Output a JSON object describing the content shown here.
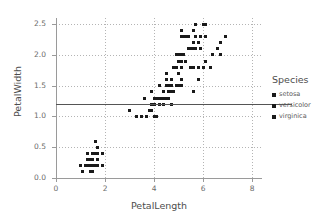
{
  "chart_data": {
    "type": "scatter",
    "title": "",
    "xlabel": "PetalLength",
    "ylabel": "PetalWidth",
    "xlim": [
      0,
      8.4
    ],
    "ylim": [
      0,
      2.6
    ],
    "xticks": [
      "0",
      "2",
      "4",
      "6",
      "8"
    ],
    "xtick_values": [
      0,
      2,
      4,
      6,
      8
    ],
    "yticks": [
      "0.0",
      "0.5",
      "1.0",
      "1.5",
      "2.0",
      "2.5"
    ],
    "ytick_values": [
      0.0,
      0.5,
      1.0,
      1.5,
      2.0,
      2.5
    ],
    "grid": true,
    "grid_style": "dotted",
    "legend_position": "right",
    "legend_title": "Species",
    "marker": "square",
    "marker_color": "#1a1a1a",
    "reference_line": {
      "orientation": "horizontal",
      "y": 1.2,
      "color": "#555555",
      "extends_into_legend": true
    },
    "series": [
      {
        "name": "setosa",
        "points": [
          [
            1.4,
            0.2
          ],
          [
            1.4,
            0.2
          ],
          [
            1.3,
            0.2
          ],
          [
            1.5,
            0.2
          ],
          [
            1.4,
            0.2
          ],
          [
            1.7,
            0.4
          ],
          [
            1.4,
            0.3
          ],
          [
            1.5,
            0.2
          ],
          [
            1.4,
            0.2
          ],
          [
            1.5,
            0.1
          ],
          [
            1.5,
            0.2
          ],
          [
            1.6,
            0.2
          ],
          [
            1.4,
            0.1
          ],
          [
            1.1,
            0.1
          ],
          [
            1.2,
            0.2
          ],
          [
            1.5,
            0.4
          ],
          [
            1.3,
            0.4
          ],
          [
            1.4,
            0.3
          ],
          [
            1.7,
            0.3
          ],
          [
            1.5,
            0.3
          ],
          [
            1.7,
            0.2
          ],
          [
            1.5,
            0.4
          ],
          [
            1.0,
            0.2
          ],
          [
            1.7,
            0.5
          ],
          [
            1.9,
            0.2
          ],
          [
            1.6,
            0.2
          ],
          [
            1.6,
            0.4
          ],
          [
            1.5,
            0.2
          ],
          [
            1.4,
            0.2
          ],
          [
            1.6,
            0.2
          ],
          [
            1.6,
            0.2
          ],
          [
            1.5,
            0.4
          ],
          [
            1.5,
            0.1
          ],
          [
            1.4,
            0.2
          ],
          [
            1.5,
            0.2
          ],
          [
            1.2,
            0.2
          ],
          [
            1.3,
            0.2
          ],
          [
            1.4,
            0.1
          ],
          [
            1.3,
            0.2
          ],
          [
            1.5,
            0.2
          ],
          [
            1.3,
            0.3
          ],
          [
            1.3,
            0.3
          ],
          [
            1.3,
            0.2
          ],
          [
            1.6,
            0.6
          ],
          [
            1.9,
            0.4
          ],
          [
            1.4,
            0.3
          ],
          [
            1.6,
            0.2
          ],
          [
            1.4,
            0.2
          ],
          [
            1.5,
            0.2
          ],
          [
            1.4,
            0.2
          ]
        ]
      },
      {
        "name": "versicolor",
        "points": [
          [
            4.7,
            1.4
          ],
          [
            4.5,
            1.5
          ],
          [
            4.9,
            1.5
          ],
          [
            4.0,
            1.3
          ],
          [
            4.6,
            1.5
          ],
          [
            4.5,
            1.3
          ],
          [
            4.7,
            1.6
          ],
          [
            3.3,
            1.0
          ],
          [
            4.6,
            1.3
          ],
          [
            3.9,
            1.4
          ],
          [
            3.5,
            1.0
          ],
          [
            4.2,
            1.5
          ],
          [
            4.0,
            1.0
          ],
          [
            4.7,
            1.4
          ],
          [
            3.6,
            1.3
          ],
          [
            4.4,
            1.4
          ],
          [
            4.5,
            1.5
          ],
          [
            4.1,
            1.0
          ],
          [
            4.5,
            1.5
          ],
          [
            3.9,
            1.1
          ],
          [
            4.8,
            1.8
          ],
          [
            4.0,
            1.3
          ],
          [
            4.9,
            1.5
          ],
          [
            4.7,
            1.2
          ],
          [
            4.3,
            1.3
          ],
          [
            4.4,
            1.4
          ],
          [
            4.8,
            1.4
          ],
          [
            5.0,
            1.7
          ],
          [
            4.5,
            1.5
          ],
          [
            3.5,
            1.0
          ],
          [
            3.8,
            1.1
          ],
          [
            3.7,
            1.0
          ],
          [
            3.9,
            1.2
          ],
          [
            5.1,
            1.6
          ],
          [
            4.5,
            1.5
          ],
          [
            4.5,
            1.6
          ],
          [
            4.7,
            1.5
          ],
          [
            4.4,
            1.3
          ],
          [
            4.1,
            1.3
          ],
          [
            4.0,
            1.3
          ],
          [
            4.4,
            1.2
          ],
          [
            4.6,
            1.4
          ],
          [
            4.0,
            1.2
          ],
          [
            3.3,
            1.0
          ],
          [
            4.2,
            1.3
          ],
          [
            4.2,
            1.2
          ],
          [
            4.2,
            1.3
          ],
          [
            4.3,
            1.3
          ],
          [
            3.0,
            1.1
          ],
          [
            4.1,
            1.3
          ]
        ]
      },
      {
        "name": "virginica",
        "points": [
          [
            6.0,
            2.5
          ],
          [
            5.1,
            1.9
          ],
          [
            5.9,
            2.1
          ],
          [
            5.6,
            1.8
          ],
          [
            5.8,
            2.2
          ],
          [
            6.6,
            2.1
          ],
          [
            4.5,
            1.7
          ],
          [
            6.3,
            1.8
          ],
          [
            5.8,
            1.8
          ],
          [
            6.1,
            2.5
          ],
          [
            5.1,
            2.0
          ],
          [
            5.3,
            1.9
          ],
          [
            5.5,
            2.1
          ],
          [
            5.0,
            2.0
          ],
          [
            5.1,
            2.4
          ],
          [
            5.3,
            2.3
          ],
          [
            5.5,
            1.8
          ],
          [
            6.7,
            2.2
          ],
          [
            6.9,
            2.3
          ],
          [
            5.0,
            1.5
          ],
          [
            5.7,
            2.3
          ],
          [
            4.9,
            2.0
          ],
          [
            6.7,
            2.0
          ],
          [
            4.9,
            1.8
          ],
          [
            5.7,
            2.1
          ],
          [
            6.0,
            1.8
          ],
          [
            4.8,
            1.8
          ],
          [
            4.9,
            1.8
          ],
          [
            5.6,
            2.1
          ],
          [
            5.8,
            1.6
          ],
          [
            6.1,
            1.9
          ],
          [
            6.4,
            2.0
          ],
          [
            5.6,
            2.2
          ],
          [
            5.1,
            1.5
          ],
          [
            5.6,
            1.4
          ],
          [
            6.1,
            2.3
          ],
          [
            5.6,
            2.4
          ],
          [
            5.5,
            1.8
          ],
          [
            4.8,
            1.8
          ],
          [
            5.4,
            2.1
          ],
          [
            5.6,
            2.4
          ],
          [
            5.1,
            2.3
          ],
          [
            5.1,
            1.9
          ],
          [
            5.9,
            2.3
          ],
          [
            5.7,
            2.5
          ],
          [
            5.2,
            2.3
          ],
          [
            5.0,
            1.9
          ],
          [
            5.2,
            2.0
          ],
          [
            5.4,
            2.3
          ],
          [
            5.1,
            1.8
          ]
        ]
      }
    ]
  },
  "legend": {
    "title": "Species",
    "items": [
      {
        "label": "setosa",
        "color": "#1a1a1a"
      },
      {
        "label": "versicolor",
        "color": "#1a1a1a"
      },
      {
        "label": "virginica",
        "color": "#1a1a1a"
      }
    ]
  }
}
